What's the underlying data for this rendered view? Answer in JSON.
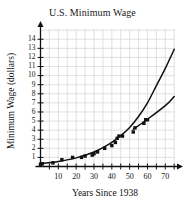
{
  "chart_data": {
    "type": "scatter",
    "title": "U.S. Minimum Wage",
    "xlabel": "Years Since 1938",
    "ylabel": "Minimum Wage (dollars)",
    "xlim": [
      0,
      76
    ],
    "ylim": [
      0,
      14.8
    ],
    "grid": true,
    "legend": "none",
    "x_ticks_major": [
      10,
      20,
      30,
      40,
      50,
      60,
      70
    ],
    "x_ticks_minor_step": 5,
    "y_ticks": [
      1,
      2,
      3,
      4,
      5,
      6,
      7,
      8,
      9,
      10,
      11,
      12,
      13,
      14
    ],
    "x_tick_labels": [
      "10",
      "20",
      "30",
      "40",
      "50",
      "60",
      "70"
    ],
    "y_tick_labels": [
      "1",
      "2",
      "3",
      "4",
      "5",
      "6",
      "7",
      "8",
      "9",
      "10",
      "11",
      "12",
      "13",
      "14"
    ],
    "series": [
      {
        "name": "Minimum wage data points",
        "type": "scatter",
        "marker": "filled-square",
        "color": "#111111",
        "points": [
          {
            "x": 0,
            "y": 0.25
          },
          {
            "x": 1,
            "y": 0.3
          },
          {
            "x": 7,
            "y": 0.4
          },
          {
            "x": 12,
            "y": 0.75
          },
          {
            "x": 18,
            "y": 1.0
          },
          {
            "x": 23,
            "y": 1.0
          },
          {
            "x": 25,
            "y": 1.15
          },
          {
            "x": 29,
            "y": 1.25
          },
          {
            "x": 30,
            "y": 1.4
          },
          {
            "x": 32,
            "y": 1.6
          },
          {
            "x": 36,
            "y": 2.0
          },
          {
            "x": 40,
            "y": 2.3
          },
          {
            "x": 42,
            "y": 2.65
          },
          {
            "x": 43,
            "y": 3.1
          },
          {
            "x": 44,
            "y": 3.35
          },
          {
            "x": 46,
            "y": 3.35
          },
          {
            "x": 52,
            "y": 3.8
          },
          {
            "x": 53,
            "y": 4.25
          },
          {
            "x": 58,
            "y": 4.75
          },
          {
            "x": 59,
            "y": 5.15
          },
          {
            "x": 60,
            "y": 5.15
          }
        ]
      },
      {
        "name": "Exponential model curve",
        "type": "curve",
        "color": "#111111",
        "end_value": 12.9,
        "points": [
          {
            "x": 0,
            "y": 0.3
          },
          {
            "x": 10,
            "y": 0.55
          },
          {
            "x": 20,
            "y": 0.95
          },
          {
            "x": 30,
            "y": 1.6
          },
          {
            "x": 38,
            "y": 2.4
          },
          {
            "x": 45,
            "y": 3.4
          },
          {
            "x": 50,
            "y": 4.3
          },
          {
            "x": 55,
            "y": 5.5
          },
          {
            "x": 60,
            "y": 7.0
          },
          {
            "x": 65,
            "y": 8.9
          },
          {
            "x": 70,
            "y": 10.8
          },
          {
            "x": 75,
            "y": 12.9
          }
        ]
      },
      {
        "name": "Linear model line",
        "type": "curve",
        "color": "#111111",
        "end_value": 7.7,
        "points": [
          {
            "x": 52,
            "y": 4.1
          },
          {
            "x": 60,
            "y": 5.2
          },
          {
            "x": 70,
            "y": 6.7
          },
          {
            "x": 75,
            "y": 7.7
          }
        ]
      }
    ]
  }
}
